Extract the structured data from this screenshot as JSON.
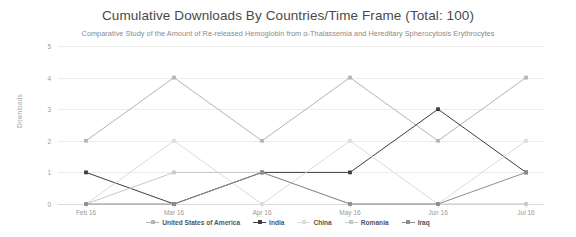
{
  "chart_data": {
    "type": "line",
    "title": "Cumulative Downloads By Countries/Time Frame (Total: 100)",
    "subtitle": "Comparative Study of the Amount of Re-released Hemoglobin from α-Thalassemia and Hereditary Spherocytosis Erythrocytes",
    "xlabel": "",
    "ylabel": "Downloads",
    "categories": [
      "Feb 16",
      "Mar 16",
      "Apr 16",
      "May 16",
      "Jun 16",
      "Jul 16"
    ],
    "ylim": [
      0,
      5
    ],
    "yticks": [
      "0",
      "1",
      "2",
      "3",
      "4",
      "5"
    ],
    "grid": true,
    "legend_position": "bottom",
    "series": [
      {
        "name": "United States of America",
        "values": [
          2,
          4,
          2,
          4,
          2,
          4
        ],
        "color": "#b4b4b4"
      },
      {
        "name": "India",
        "values": [
          1,
          0,
          1,
          1,
          3,
          1
        ],
        "color": "#3d3d3d"
      },
      {
        "name": "China",
        "values": [
          0,
          2,
          0,
          2,
          0,
          2
        ],
        "color": "#dcdcdc"
      },
      {
        "name": "Romania",
        "values": [
          0,
          1,
          1,
          0,
          0,
          0
        ],
        "color": "#c8c8c8"
      },
      {
        "name": "Iraq",
        "values": [
          0,
          0,
          1,
          0,
          0,
          1
        ],
        "color": "#8e8e8e"
      }
    ]
  }
}
